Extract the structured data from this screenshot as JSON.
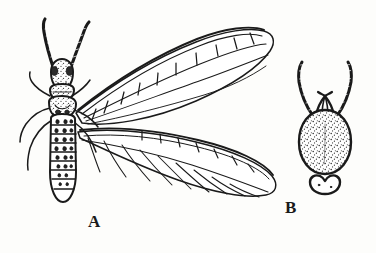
{
  "figure": {
    "kind": "scientific-illustration",
    "medium": "pen-and-ink engraving",
    "background_color": "#fdfdfb",
    "ink_color": "#1a1a1a",
    "width": 376,
    "height": 253
  },
  "labels": {
    "a": "A",
    "b": "B"
  },
  "specimen_a": {
    "name": "winged-insect",
    "label": "A",
    "parts": [
      "antenna-left",
      "antenna-right",
      "head",
      "thorax",
      "abdomen",
      "forewing",
      "hindwing",
      "legs"
    ],
    "antennae_count": 2,
    "wing_count": 2,
    "abdomen_segments": 8,
    "orientation": "dorsal view, head up"
  },
  "specimen_b": {
    "name": "wingless-insect",
    "label": "B",
    "parts": [
      "antenna-left",
      "antenna-right",
      "mouthparts",
      "body",
      "lobed-appendage"
    ],
    "antennae_count": 2,
    "wing_count": 0,
    "body_texture": "stippled",
    "orientation": "dorsal view, head up"
  }
}
